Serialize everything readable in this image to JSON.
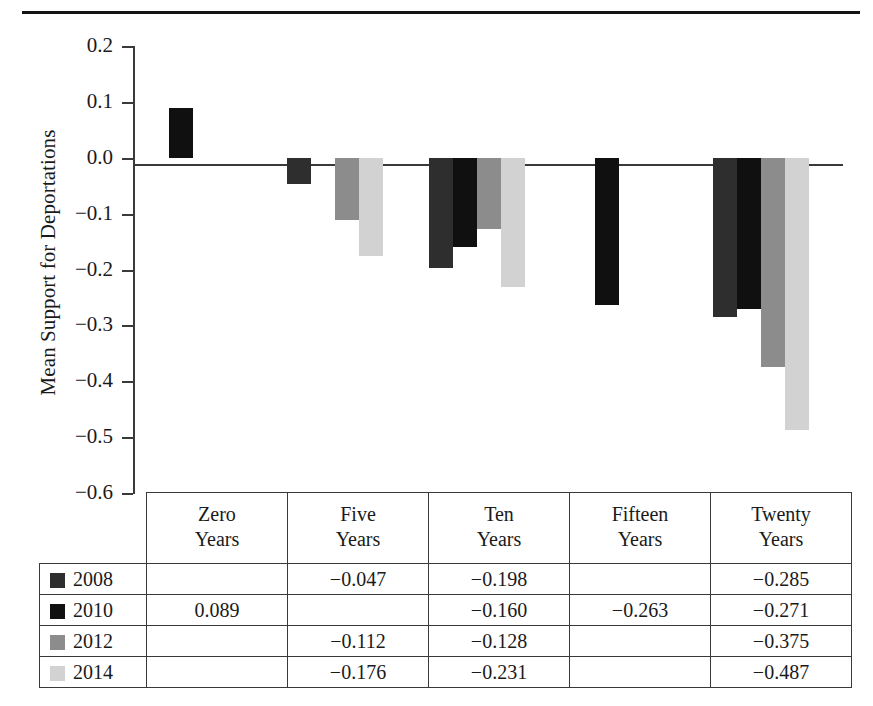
{
  "chart_data": {
    "type": "bar",
    "title": "",
    "subtitle": "",
    "xlabel": "",
    "ylabel": "Mean Support for Deportations",
    "ylim": [
      -0.6,
      0.2
    ],
    "ytick_labels": [
      "0.2",
      "0.1",
      "0.0",
      "−0.1",
      "−0.2",
      "−0.3",
      "−0.4",
      "−0.5",
      "−0.6"
    ],
    "ytick_values": [
      0.2,
      0.1,
      0.0,
      -0.1,
      -0.2,
      -0.3,
      -0.4,
      -0.5,
      -0.6
    ],
    "grid": false,
    "legend_position": "table-left-column",
    "categories": [
      "Zero Years",
      "Five Years",
      "Ten Years",
      "Fifteen Years",
      "Twenty Years"
    ],
    "category_lines": [
      [
        "Zero",
        "Years"
      ],
      [
        "Five",
        "Years"
      ],
      [
        "Ten",
        "Years"
      ],
      [
        "Fifteen",
        "Years"
      ],
      [
        "Twenty",
        "Years"
      ]
    ],
    "series": [
      {
        "name": "2008",
        "color": "#2e2e2e",
        "values": [
          null,
          -0.047,
          -0.198,
          null,
          -0.285
        ],
        "labels": [
          "",
          "−0.047",
          "−0.198",
          "",
          "−0.285"
        ]
      },
      {
        "name": "2010",
        "color": "#101010",
        "values": [
          0.089,
          null,
          -0.16,
          -0.263,
          -0.271
        ],
        "labels": [
          "0.089",
          "",
          "−0.160",
          "−0.263",
          "−0.271"
        ]
      },
      {
        "name": "2012",
        "color": "#8c8c8c",
        "values": [
          null,
          -0.112,
          -0.128,
          null,
          -0.375
        ],
        "labels": [
          "",
          "−0.112",
          "−0.128",
          "",
          "−0.375"
        ]
      },
      {
        "name": "2014",
        "color": "#d2d2d2",
        "values": [
          null,
          -0.176,
          -0.231,
          null,
          -0.487
        ],
        "labels": [
          "",
          "−0.176",
          "−0.231",
          "",
          "−0.487"
        ]
      }
    ]
  },
  "table": {
    "header_blank": "",
    "row_label_key": "series-name"
  },
  "colors": {
    "axis": "#3a3a3a",
    "rule": "#141414",
    "background": "#ffffff",
    "text": "#1a1a1a"
  }
}
